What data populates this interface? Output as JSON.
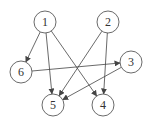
{
  "diagram": {
    "type": "directed-graph",
    "nodes": [
      {
        "id": "1",
        "label": "1",
        "x": 45,
        "y": 22
      },
      {
        "id": "2",
        "label": "2",
        "x": 108,
        "y": 22
      },
      {
        "id": "3",
        "label": "3",
        "x": 131,
        "y": 62
      },
      {
        "id": "4",
        "label": "4",
        "x": 103,
        "y": 105
      },
      {
        "id": "5",
        "label": "5",
        "x": 53,
        "y": 105
      },
      {
        "id": "6",
        "label": "6",
        "x": 21,
        "y": 72
      }
    ],
    "edges": [
      {
        "from": "1",
        "to": "6"
      },
      {
        "from": "1",
        "to": "5"
      },
      {
        "from": "1",
        "to": "4"
      },
      {
        "from": "2",
        "to": "5"
      },
      {
        "from": "2",
        "to": "4"
      },
      {
        "from": "6",
        "to": "3"
      },
      {
        "from": "3",
        "to": "5"
      }
    ],
    "style": {
      "stroke": "#444444",
      "node_radius": 11
    }
  }
}
